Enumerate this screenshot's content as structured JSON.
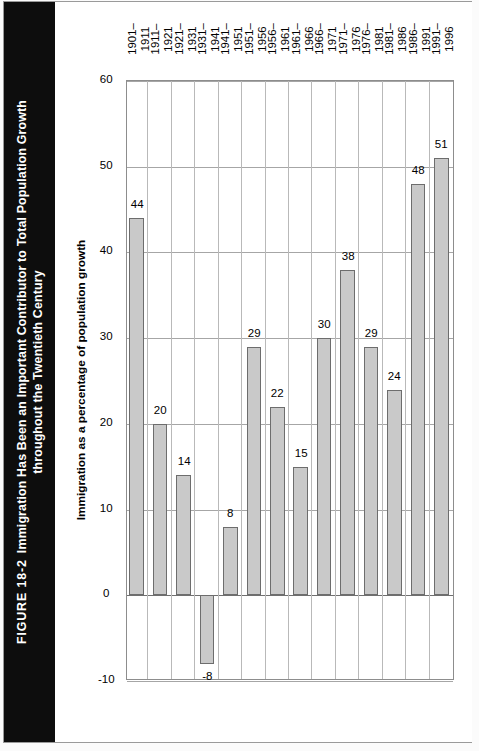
{
  "figure": {
    "number_label": "FIGURE 18-2",
    "title_line1": "Immigration Has Been an Important Contributor to Total Population Growth",
    "title_line2": "throughout the Twentieth Century",
    "banner_color": "#0d0d0d",
    "banner_text_color": "#ffffff"
  },
  "chart_data": {
    "type": "bar",
    "orientation": "horizontal",
    "title": "Immigration Has Been an Important Contributor to Total Population Growth throughout the Twentieth Century",
    "xlabel": "",
    "ylabel": "Immigration as a percentage of population growth",
    "value_axis_title": "Immigration as a percentage of population growth",
    "categories": [
      "1901–\n1911",
      "1911–\n1921",
      "1921–\n1931",
      "1931–\n1941",
      "1941–\n1951",
      "1951–\n1956",
      "1956–\n1961",
      "1961–\n1966",
      "1966–\n1971",
      "1971–\n1976",
      "1976–\n1981",
      "1981–\n1986",
      "1986–\n1991",
      "1991–\n1996"
    ],
    "category_lines": [
      [
        "1901–",
        "1911"
      ],
      [
        "1911–",
        "1921"
      ],
      [
        "1921–",
        "1931"
      ],
      [
        "1931–",
        "1941"
      ],
      [
        "1941–",
        "1951"
      ],
      [
        "1951–",
        "1956"
      ],
      [
        "1956–",
        "1961"
      ],
      [
        "1961–",
        "1966"
      ],
      [
        "1966–",
        "1971"
      ],
      [
        "1971–",
        "1976"
      ],
      [
        "1976–",
        "1981"
      ],
      [
        "1981–",
        "1986"
      ],
      [
        "1986–",
        "1991"
      ],
      [
        "1991–",
        "1996"
      ]
    ],
    "values": [
      44,
      20,
      14,
      -8,
      8,
      29,
      22,
      15,
      30,
      38,
      29,
      24,
      48,
      51
    ],
    "data_labels": [
      "44",
      "20",
      "14",
      "-8",
      "8",
      "29",
      "22",
      "15",
      "30",
      "38",
      "29",
      "24",
      "48",
      "51"
    ],
    "ylim": [
      -10,
      60
    ],
    "value_ticks": [
      -10,
      0,
      10,
      20,
      30,
      40,
      50,
      60
    ],
    "value_tick_labels": [
      "-10",
      "0",
      "10",
      "20",
      "30",
      "40",
      "50",
      "60"
    ],
    "grid": true,
    "legend": null,
    "bar_fill": "#c9c9c9",
    "bar_edge": "#6d6d6d",
    "gridline_color": "#a6a6a6",
    "zero_line_color": "#6f6f6f",
    "plot_border_color": "#8d8d8d",
    "background": "#ffffff"
  }
}
